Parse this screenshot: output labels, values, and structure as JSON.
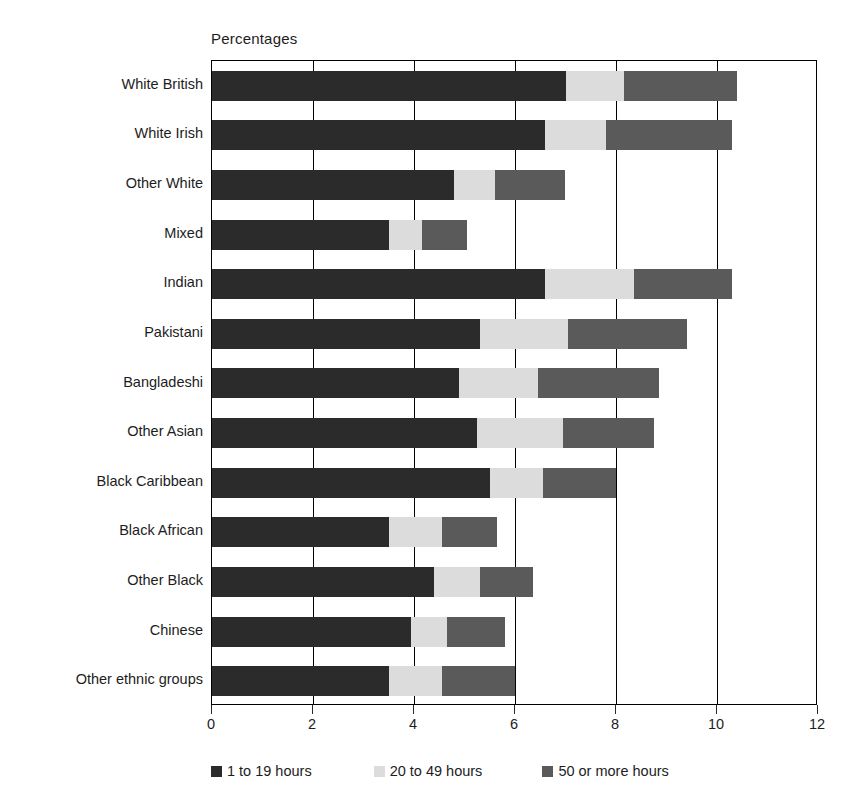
{
  "chart_data": {
    "type": "bar",
    "subtype": "horizontal-stacked-bar",
    "title": "",
    "axis_title": "Percentages",
    "xlabel": "",
    "ylabel": "",
    "xlim": [
      0,
      12
    ],
    "xticks": [
      0,
      2,
      4,
      6,
      8,
      10,
      12
    ],
    "xtick_labels": [
      "0",
      "2",
      "4",
      "6",
      "8",
      "10",
      "12"
    ],
    "grid": true,
    "grid_axis": "x",
    "legend_position": "bottom",
    "categories": [
      "White British",
      "White Irish",
      "Other White",
      "Mixed",
      "Indian",
      "Pakistani",
      "Bangladeshi",
      "Other Asian",
      "Black Caribbean",
      "Black African",
      "Other Black",
      "Chinese",
      "Other ethnic groups"
    ],
    "series": [
      {
        "name": "1 to 19 hours",
        "color": "#2b2b2b",
        "values": [
          7.0,
          6.6,
          4.8,
          3.5,
          6.6,
          5.3,
          4.9,
          5.25,
          5.5,
          3.5,
          4.4,
          3.95,
          3.5
        ]
      },
      {
        "name": "20 to 49 hours",
        "color": "#dcdcdc",
        "values": [
          1.15,
          1.2,
          0.8,
          0.65,
          1.75,
          1.75,
          1.55,
          1.7,
          1.05,
          1.05,
          0.9,
          0.7,
          1.05
        ]
      },
      {
        "name": "50 or more hours",
        "color": "#5a5a5a",
        "values": [
          2.25,
          2.5,
          1.4,
          0.9,
          1.95,
          2.35,
          2.4,
          1.8,
          1.45,
          1.1,
          1.05,
          1.15,
          1.45
        ]
      }
    ],
    "totals": [
      10.4,
      10.3,
      7.0,
      5.05,
      10.3,
      9.4,
      8.85,
      8.75,
      8.0,
      5.65,
      6.35,
      5.8,
      6.0
    ]
  },
  "legend": {
    "items": [
      {
        "label": "1 to 19 hours",
        "color": "#2b2b2b"
      },
      {
        "label": "20 to 49 hours",
        "color": "#dcdcdc"
      },
      {
        "label": "50 or more hours",
        "color": "#5a5a5a"
      }
    ]
  },
  "colors": {
    "series_1": "#2b2b2b",
    "series_2": "#dcdcdc",
    "series_3": "#5a5a5a",
    "axis": "#000000",
    "text": "#1d1d1d",
    "background": "#ffffff"
  }
}
